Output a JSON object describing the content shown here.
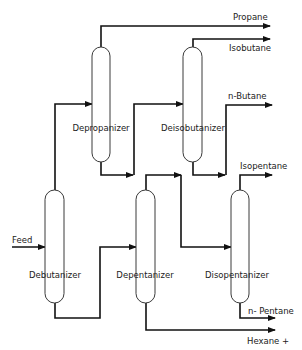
{
  "diagram": {
    "type": "process-flow",
    "title": "",
    "columns": [
      {
        "id": "debutanizer",
        "label": "Debutanizer"
      },
      {
        "id": "depropanizer",
        "label": "Depropanizer"
      },
      {
        "id": "deisobutanizer",
        "label": "Deisobutanizer"
      },
      {
        "id": "depentanizer",
        "label": "Depentanizer"
      },
      {
        "id": "disopentanizer",
        "label": "Disopentanizer"
      }
    ],
    "streams": {
      "feed": "Feed",
      "propane": "Propane",
      "isobutane": "Isobutane",
      "n_butane": "n-Butane",
      "isopentane": "Isopentane",
      "n_pentane": "n- Pentane",
      "hexane": "Hexane +"
    },
    "connections": [
      {
        "from": "Feed",
        "to": "Debutanizer"
      },
      {
        "from": "Debutanizer (top)",
        "to": "Depropanizer"
      },
      {
        "from": "Debutanizer (bottom)",
        "to": "Depentanizer"
      },
      {
        "from": "Depropanizer (top)",
        "to": "Propane"
      },
      {
        "from": "Depropanizer (bottom)",
        "to": "Deisobutanizer"
      },
      {
        "from": "Deisobutanizer (top)",
        "to": "Isobutane"
      },
      {
        "from": "Deisobutanizer (bottom)",
        "to": "n-Butane"
      },
      {
        "from": "Depentanizer (top)",
        "to": "Disopentanizer"
      },
      {
        "from": "Depentanizer (bottom)",
        "to": "Hexane +"
      },
      {
        "from": "Disopentanizer (top)",
        "to": "Isopentane"
      },
      {
        "from": "Disopentanizer (bottom)",
        "to": "n- Pentane"
      }
    ]
  }
}
